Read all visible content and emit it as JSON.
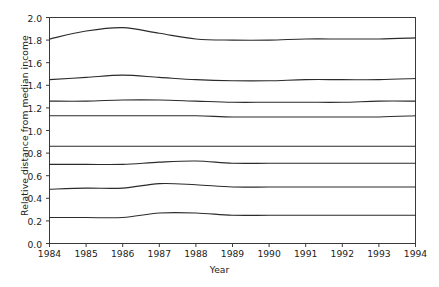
{
  "chart_data": {
    "type": "line",
    "title": "",
    "xlabel": "Year",
    "ylabel": "Relative distance from median income",
    "x": [
      1984,
      1985,
      1986,
      1987,
      1988,
      1989,
      1990,
      1991,
      1992,
      1993,
      1994
    ],
    "xlim": [
      1984,
      1994
    ],
    "ylim": [
      0.0,
      2.0
    ],
    "xticks": [
      "1984",
      "1985",
      "1986",
      "1987",
      "1988",
      "1989",
      "1990",
      "1991",
      "1992",
      "1993",
      "1994"
    ],
    "yticks": [
      "0.0",
      "0.2",
      "0.4",
      "0.6",
      "0.8",
      "1.0",
      "1.2",
      "1.4",
      "1.6",
      "1.8",
      "2.0"
    ],
    "grid": false,
    "legend": "none",
    "series": [
      {
        "name": "p95",
        "values": [
          1.81,
          1.88,
          1.91,
          1.86,
          1.81,
          1.8,
          1.8,
          1.81,
          1.81,
          1.81,
          1.82
        ]
      },
      {
        "name": "p90",
        "values": [
          1.45,
          1.47,
          1.49,
          1.47,
          1.45,
          1.44,
          1.44,
          1.45,
          1.45,
          1.45,
          1.46
        ]
      },
      {
        "name": "p80",
        "values": [
          1.26,
          1.26,
          1.27,
          1.27,
          1.26,
          1.25,
          1.25,
          1.25,
          1.25,
          1.26,
          1.26
        ]
      },
      {
        "name": "p70",
        "values": [
          1.13,
          1.13,
          1.13,
          1.13,
          1.13,
          1.12,
          1.12,
          1.12,
          1.12,
          1.12,
          1.13
        ]
      },
      {
        "name": "p30",
        "values": [
          0.86,
          0.86,
          0.86,
          0.86,
          0.86,
          0.86,
          0.86,
          0.86,
          0.86,
          0.86,
          0.86
        ]
      },
      {
        "name": "p20",
        "values": [
          0.7,
          0.7,
          0.7,
          0.72,
          0.73,
          0.71,
          0.71,
          0.71,
          0.71,
          0.71,
          0.71
        ]
      },
      {
        "name": "p10",
        "values": [
          0.48,
          0.49,
          0.49,
          0.53,
          0.52,
          0.5,
          0.5,
          0.5,
          0.5,
          0.5,
          0.5
        ]
      },
      {
        "name": "p05",
        "values": [
          0.23,
          0.23,
          0.23,
          0.27,
          0.27,
          0.25,
          0.25,
          0.25,
          0.25,
          0.25,
          0.25
        ]
      }
    ]
  }
}
